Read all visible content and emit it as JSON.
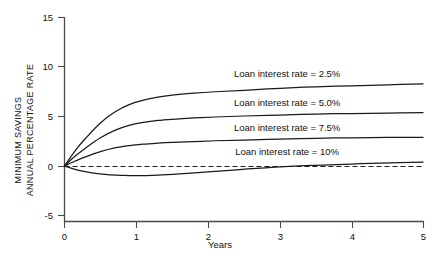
{
  "chart_data": {
    "type": "line",
    "title": "",
    "xlabel": "Years",
    "ylabel": "MINIMUM SAVINGS ANNUAL PERCENTAGE RATE",
    "ylabel_line1": "MINIMUM SAVINGS",
    "ylabel_line2": "ANNUAL PERCENTAGE RATE",
    "xlim": [
      0,
      5
    ],
    "ylim": [
      -5,
      15
    ],
    "xticks": [
      "0",
      "1",
      "2",
      "3",
      "4",
      "5"
    ],
    "xtick_values": [
      0,
      1,
      2,
      3,
      4,
      5
    ],
    "yticks": [
      "15",
      "10",
      "5",
      "0",
      "-5"
    ],
    "ytick_values": [
      15,
      10,
      5,
      0,
      -5
    ],
    "grid": false,
    "legend_position": "inline-annotations",
    "zero_reference_line": 0,
    "series": [
      {
        "name": "Loan interest rate = 2.5%",
        "label": "Loan interest rate = 2.5%",
        "label_x": 3.1,
        "label_y": 9.0,
        "x": [
          0,
          0.15,
          0.3,
          0.5,
          0.7,
          0.9,
          1.1,
          1.3,
          1.5,
          1.8,
          2.1,
          2.5,
          3.0,
          3.5,
          4.0,
          4.5,
          5.0
        ],
        "values": [
          0,
          1.55,
          2.85,
          4.35,
          5.45,
          6.2,
          6.65,
          6.95,
          7.15,
          7.35,
          7.5,
          7.65,
          7.85,
          8.0,
          8.1,
          8.2,
          8.3
        ]
      },
      {
        "name": "Loan interest rate = 5.0%",
        "label": "Loan interest rate = 5.0%",
        "label_x": 3.1,
        "label_y": 6.1,
        "x": [
          0,
          0.15,
          0.3,
          0.5,
          0.7,
          0.9,
          1.1,
          1.3,
          1.5,
          1.8,
          2.1,
          2.5,
          3.0,
          3.5,
          4.0,
          4.5,
          5.0
        ],
        "values": [
          0,
          1.0,
          1.85,
          2.85,
          3.6,
          4.1,
          4.4,
          4.6,
          4.72,
          4.85,
          4.95,
          5.05,
          5.15,
          5.25,
          5.3,
          5.35,
          5.4
        ]
      },
      {
        "name": "Loan interest rate = 7.5%",
        "label": "Loan interest rate = 7.5%",
        "label_x": 3.1,
        "label_y": 3.5,
        "x": [
          0,
          0.15,
          0.3,
          0.5,
          0.7,
          0.9,
          1.1,
          1.3,
          1.5,
          1.8,
          2.1,
          2.5,
          3.0,
          3.5,
          4.0,
          4.5,
          5.0
        ],
        "values": [
          0,
          0.5,
          0.95,
          1.45,
          1.82,
          2.05,
          2.2,
          2.3,
          2.38,
          2.47,
          2.55,
          2.62,
          2.72,
          2.8,
          2.85,
          2.88,
          2.9
        ]
      },
      {
        "name": "Loan interest rate = 10%",
        "label": "Loan interest rate = 10%",
        "label_x": 3.1,
        "label_y": 1.1,
        "x": [
          0,
          0.2,
          0.4,
          0.6,
          0.8,
          1.0,
          1.3,
          1.6,
          2.0,
          2.4,
          2.8,
          3.2,
          3.6,
          4.0,
          4.4,
          5.0
        ],
        "values": [
          0,
          -0.45,
          -0.72,
          -0.88,
          -0.95,
          -0.98,
          -0.92,
          -0.8,
          -0.6,
          -0.38,
          -0.18,
          -0.02,
          0.1,
          0.2,
          0.3,
          0.4
        ]
      }
    ]
  },
  "axes": {
    "x_title": "Years",
    "y_title_line1": "MINIMUM SAVINGS",
    "y_title_line2": "ANNUAL PERCENTAGE RATE"
  }
}
